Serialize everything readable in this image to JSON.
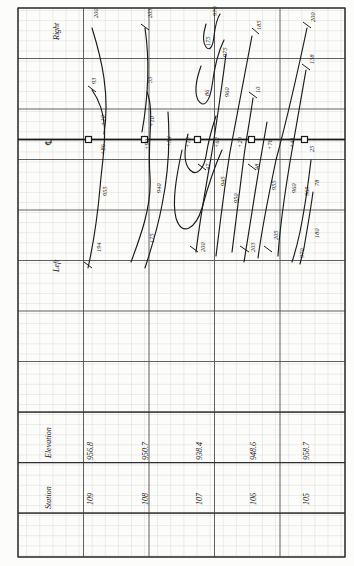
{
  "drawing": {
    "title": "Roadway Cross-Section Grading Sheet",
    "orientation_note": "all lettering rotated 90 degrees (sheet read sideways)",
    "side_labels": {
      "top": "Right",
      "bottom": "Left"
    },
    "centerline_symbol": "℄",
    "ink_color": "#1b1b1b",
    "grid_minor_color": "#b9b9b9",
    "grid_major_color": "#4a4a4a",
    "paper_color": "#fcfcfa"
  },
  "table": {
    "row_labels": {
      "elevation": "Elevation",
      "station": "Station"
    },
    "columns": [
      {
        "station": "109",
        "elevation": "956.8"
      },
      {
        "station": "108",
        "elevation": "950.7"
      },
      {
        "station": "107",
        "elevation": "938.4"
      },
      {
        "station": "106",
        "elevation": "948.6"
      },
      {
        "station": "105",
        "elevation": "958.7"
      }
    ]
  },
  "station_markers": [
    {
      "station": "109",
      "above": "+10",
      "below": "+86"
    },
    {
      "station": "108",
      "above": "+10",
      "below": "+90"
    },
    {
      "station": "107",
      "above": "+15",
      "below": "+62"
    },
    {
      "station": "106",
      "above": "+29",
      "below": "+78"
    },
    {
      "station": "105",
      "above": "+41",
      "below": "+25"
    }
  ],
  "offset_labels": [
    "+86",
    "+10",
    "+90",
    "+10",
    "+54",
    "+15",
    "+62",
    "+29",
    "+78",
    "+41",
    "+25"
  ],
  "curve_labels": {
    "upper_right": [
      "200",
      "93",
      "203",
      "55",
      "970",
      "175",
      "975",
      "86",
      "960",
      "185",
      "10",
      "200",
      "138"
    ],
    "lower_left": [
      "955",
      "194",
      "940",
      "175",
      "950",
      "945",
      "960",
      "200",
      "203",
      "48",
      "955",
      "960",
      "965",
      "205",
      "78",
      "180",
      "970",
      "25",
      "47"
    ]
  },
  "annotations": [
    {
      "text": "200",
      "x": 92,
      "y": 18,
      "rot": -90,
      "cls": "curveLbl"
    },
    {
      "text": "93",
      "x": 90,
      "y": 84,
      "rot": -90,
      "cls": "curveLbl"
    },
    {
      "text": "+10",
      "x": 99,
      "y": 126,
      "rot": -90,
      "cls": "curveLbl"
    },
    {
      "text": "+86",
      "x": 99,
      "y": 155,
      "rot": -90,
      "cls": "curveLbl"
    },
    {
      "text": "955",
      "x": 101,
      "y": 196,
      "rot": -90,
      "cls": "curveLbl"
    },
    {
      "text": "194",
      "x": 95,
      "y": 252,
      "rot": -90,
      "cls": "curveLbl"
    },
    {
      "text": "203",
      "x": 146,
      "y": 18,
      "rot": -90,
      "cls": "curveLbl"
    },
    {
      "text": "55",
      "x": 146,
      "y": 83,
      "rot": -90,
      "cls": "curveLbl"
    },
    {
      "text": "+10",
      "x": 148,
      "y": 127,
      "rot": -90,
      "cls": "curveLbl"
    },
    {
      "text": "+90",
      "x": 143,
      "y": 150,
      "rot": -90,
      "cls": "curveLbl"
    },
    {
      "text": "940",
      "x": 155,
      "y": 193,
      "rot": -90,
      "cls": "curveLbl"
    },
    {
      "text": "175",
      "x": 148,
      "y": 243,
      "rot": -90,
      "cls": "curveLbl"
    },
    {
      "text": "+54",
      "x": 165,
      "y": 147,
      "rot": -90,
      "cls": "curveLbl"
    },
    {
      "text": "970",
      "x": 211,
      "y": 16,
      "rot": -90,
      "cls": "curveLbl"
    },
    {
      "text": "175",
      "x": 204,
      "y": 46,
      "rot": -90,
      "cls": "curveLbl"
    },
    {
      "text": "975",
      "x": 221,
      "y": 57,
      "rot": -90,
      "cls": "curveLbl"
    },
    {
      "text": "86",
      "x": 203,
      "y": 96,
      "rot": -90,
      "cls": "curveLbl"
    },
    {
      "text": "+15",
      "x": 184,
      "y": 148,
      "rot": -90,
      "cls": "curveLbl"
    },
    {
      "text": "+62",
      "x": 213,
      "y": 148,
      "rot": -90,
      "cls": "curveLbl"
    },
    {
      "text": "47",
      "x": 204,
      "y": 170,
      "rot": -90,
      "cls": "curveLbl"
    },
    {
      "text": "960",
      "x": 223,
      "y": 97,
      "rot": -90,
      "cls": "curveLbl"
    },
    {
      "text": "945",
      "x": 219,
      "y": 186,
      "rot": -90,
      "cls": "curveLbl"
    },
    {
      "text": "950",
      "x": 232,
      "y": 203,
      "rot": -90,
      "cls": "curveLbl"
    },
    {
      "text": "200",
      "x": 199,
      "y": 252,
      "rot": -90,
      "cls": "curveLbl"
    },
    {
      "text": "185",
      "x": 255,
      "y": 30,
      "rot": -90,
      "cls": "curveLbl"
    },
    {
      "text": "10",
      "x": 254,
      "y": 93,
      "rot": -90,
      "cls": "curveLbl"
    },
    {
      "text": "+29",
      "x": 236,
      "y": 148,
      "rot": -90,
      "cls": "curveLbl"
    },
    {
      "text": "48",
      "x": 253,
      "y": 170,
      "rot": -90,
      "cls": "curveLbl"
    },
    {
      "text": "955",
      "x": 270,
      "y": 190,
      "rot": -90,
      "cls": "curveLbl"
    },
    {
      "text": "203",
      "x": 249,
      "y": 252,
      "rot": -90,
      "cls": "curveLbl"
    },
    {
      "text": "+78",
      "x": 266,
      "y": 150,
      "rot": -90,
      "cls": "curveLbl"
    },
    {
      "text": "200",
      "x": 309,
      "y": 22,
      "rot": -90,
      "cls": "curveLbl"
    },
    {
      "text": "960",
      "x": 290,
      "y": 193,
      "rot": -90,
      "cls": "curveLbl"
    },
    {
      "text": "+41",
      "x": 288,
      "y": 148,
      "rot": -90,
      "cls": "curveLbl"
    },
    {
      "text": "138",
      "x": 308,
      "y": 64,
      "rot": -90,
      "cls": "curveLbl"
    },
    {
      "text": "25",
      "x": 308,
      "y": 152,
      "rot": -90,
      "cls": "curveLbl"
    },
    {
      "text": "965",
      "x": 303,
      "y": 196,
      "rot": -90,
      "cls": "curveLbl"
    },
    {
      "text": "78",
      "x": 313,
      "y": 186,
      "rot": -90,
      "cls": "curveLbl"
    },
    {
      "text": "180",
      "x": 313,
      "y": 238,
      "rot": -90,
      "cls": "curveLbl"
    },
    {
      "text": "970",
      "x": 298,
      "y": 258,
      "rot": -90,
      "cls": "curveLbl"
    },
    {
      "text": "205",
      "x": 272,
      "y": 240,
      "rot": -90,
      "cls": "curveLbl"
    }
  ]
}
